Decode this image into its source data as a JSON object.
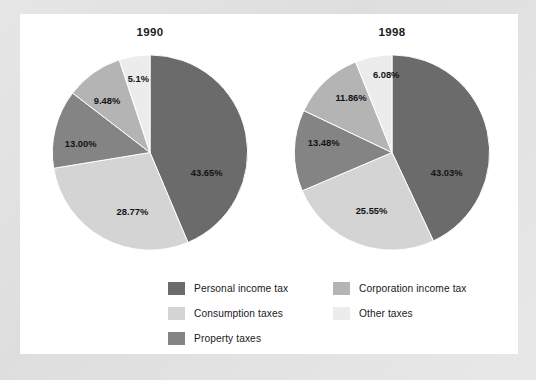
{
  "chart_data": [
    {
      "type": "pie",
      "title": "1990",
      "categories": [
        "Personal income tax",
        "Consumption taxes",
        "Property taxes",
        "Corporation income tax",
        "Other taxes"
      ],
      "values": [
        43.65,
        28.77,
        13.0,
        9.48,
        5.1
      ],
      "labels": [
        "43.65%",
        "28.77%",
        "13.00%",
        "9.48%",
        "5.1%"
      ],
      "colors": [
        "#6b6b6b",
        "#d4d4d4",
        "#848484",
        "#b4b4b4",
        "#ececec"
      ],
      "legend_position": "bottom",
      "grid": false
    },
    {
      "type": "pie",
      "title": "1998",
      "categories": [
        "Personal income tax",
        "Consumption taxes",
        "Property taxes",
        "Corporation income tax",
        "Other taxes"
      ],
      "values": [
        43.03,
        25.55,
        13.48,
        11.86,
        6.08
      ],
      "labels": [
        "43.03%",
        "25.55%",
        "13.48%",
        "11.86%",
        "6.08%"
      ],
      "colors": [
        "#6b6b6b",
        "#d4d4d4",
        "#848484",
        "#b4b4b4",
        "#ececec"
      ],
      "legend_position": "bottom",
      "grid": false
    }
  ],
  "charts": {
    "left": {
      "title": "1990",
      "slices": [
        {
          "label": "43.65%",
          "value": 43.65,
          "color": "#6b6b6b",
          "lx": 58,
          "ly": 22
        },
        {
          "label": "28.77%",
          "value": 28.77,
          "color": "#d4d4d4",
          "lx": -18,
          "ly": 61
        },
        {
          "label": "13.00%",
          "value": 13.0,
          "color": "#848484",
          "lx": -71,
          "ly": -8
        },
        {
          "label": "9.48%",
          "value": 9.48,
          "color": "#b4b4b4",
          "lx": -44,
          "ly": -52
        },
        {
          "label": "5.1%",
          "value": 5.1,
          "color": "#ececec",
          "lx": -12,
          "ly": -75
        }
      ]
    },
    "right": {
      "title": "1998",
      "slices": [
        {
          "label": "43.03%",
          "value": 43.03,
          "color": "#6b6b6b",
          "lx": 56,
          "ly": 22
        },
        {
          "label": "25.55%",
          "value": 25.55,
          "color": "#d4d4d4",
          "lx": -21,
          "ly": 60
        },
        {
          "label": "13.48%",
          "value": 13.48,
          "color": "#848484",
          "lx": -70,
          "ly": -9
        },
        {
          "label": "11.86%",
          "value": 11.86,
          "color": "#b4b4b4",
          "lx": -42,
          "ly": -55
        },
        {
          "label": "6.08%",
          "value": 6.08,
          "color": "#ececec",
          "lx": -6,
          "ly": -79
        }
      ]
    }
  },
  "legend": {
    "left_column": [
      {
        "label": "Personal income tax",
        "color": "#6b6b6b"
      },
      {
        "label": "Consumption taxes",
        "color": "#d4d4d4"
      },
      {
        "label": "Property taxes",
        "color": "#848484"
      }
    ],
    "right_column": [
      {
        "label": "Corporation income tax",
        "color": "#b4b4b4"
      },
      {
        "label": "Other taxes",
        "color": "#ececec"
      }
    ]
  }
}
